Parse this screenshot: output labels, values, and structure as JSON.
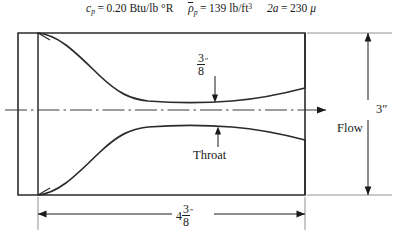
{
  "figure": {
    "type": "engineering-cross-section-diagram",
    "header": {
      "formulas": [
        {
          "id": "specific-heat",
          "symbol": "c",
          "symbol_subscript": "p",
          "equals": "=",
          "value": "0.20",
          "units": "Btu/lb °R",
          "plain": "c_p = 0.20 Btu/lb °R"
        },
        {
          "id": "particle-density",
          "symbol": "ρ",
          "symbol_overbar": true,
          "symbol_subscript": "p",
          "equals": "=",
          "value": "139",
          "units": "lb/ft",
          "units_superscript": "3",
          "plain": "ρ̄_p = 139 lb/ft3"
        },
        {
          "id": "particle-diameter",
          "symbol": "2a",
          "equals": "=",
          "value": "230",
          "units": "μ",
          "plain": "2a = 230 μ"
        }
      ]
    },
    "dimensions": [
      {
        "id": "throat-height",
        "numerator": "3",
        "denominator": "8",
        "unit_mark": "″",
        "plain": "3/8″",
        "description": "throat half-height dimension with downward arrow"
      },
      {
        "id": "overall-length",
        "whole": "4",
        "numerator": "3",
        "denominator": "8",
        "unit_mark": "″",
        "plain": "4 3/8″",
        "description": "overall nozzle length, bottom dimension line"
      },
      {
        "id": "overall-height",
        "value": "3″",
        "plain": "3″",
        "description": "overall duct height, right side vertical dimension"
      }
    ],
    "annotations": [
      {
        "id": "throat",
        "label": "Throat",
        "description": "leader arrow pointing up to lower throat contour"
      },
      {
        "id": "flow",
        "label": "Flow",
        "description": "flow direction arrow along centerline pointing right"
      }
    ],
    "colors": {
      "ink": "#1a1a1a",
      "line": "#2b2b2b",
      "thin_line": "#555555",
      "background": "#ffffff"
    }
  }
}
